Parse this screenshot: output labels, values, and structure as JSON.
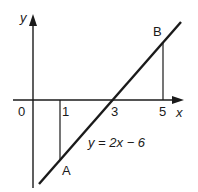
{
  "diagram": {
    "axes": {
      "x_label": "x",
      "y_label": "y"
    },
    "ticks": [
      {
        "label": "0",
        "x": 0
      },
      {
        "label": "1",
        "x": 1
      },
      {
        "label": "3",
        "x": 3
      },
      {
        "label": "5",
        "x": 5
      }
    ],
    "line_equation": "y = 2x − 6",
    "points": [
      {
        "label": "A",
        "x": 1,
        "y": -4
      },
      {
        "label": "B",
        "x": 5,
        "y": 4
      }
    ],
    "colors": {
      "ink": "#1a1a1a",
      "background": "#ffffff"
    }
  }
}
